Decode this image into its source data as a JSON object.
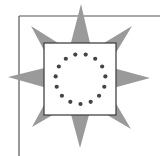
{
  "figure": {
    "colors": {
      "background": "#ffffff",
      "frame": "#555555",
      "star": "#9a9a9a",
      "square_fill": "#ffffff",
      "square_border": "#444444",
      "dots": "#444444"
    },
    "frame": {
      "left_x": 19,
      "top_y": 16
    },
    "square": {
      "x": 44,
      "y": 43,
      "size": 72
    },
    "star": {
      "center": [
        80,
        78
      ],
      "points": [
        [
          81,
          4
        ],
        [
          132,
          26
        ],
        [
          150,
          78
        ],
        [
          131,
          129
        ],
        [
          80,
          148
        ],
        [
          32,
          127
        ],
        [
          8,
          77
        ],
        [
          31,
          26
        ]
      ]
    },
    "dot_ring": {
      "count": 15,
      "center": [
        80.5,
        79
      ],
      "radius": 25,
      "dot_radius": 2.1
    }
  }
}
